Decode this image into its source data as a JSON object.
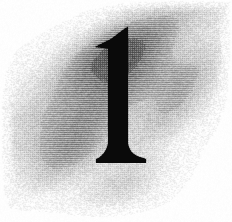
{
  "image": {
    "kind": "decorative-drop-cap",
    "width": 232,
    "height": 222,
    "background_color": "#ffffff",
    "description": "Scanned decorative drop capital: the numeral 1 in a black serif face over a soft diagonal grey cloud wash with visible halftone dot texture",
    "rendering": "halftone",
    "alt_text": "1"
  },
  "glyph": {
    "character": "1",
    "name": "numeral-one",
    "style": "serif",
    "color": "#0a0a0a",
    "top_y": 27,
    "baseline_y": 163,
    "stem": {
      "left_x": 108,
      "right_x": 128,
      "width": 20
    },
    "flag": {
      "tip_x": 95,
      "tip_y": 47,
      "top_y": 27
    },
    "foot_serif": {
      "left_x": 96,
      "right_x": 146,
      "width": 50,
      "top_y": 158,
      "bottom_y": 163,
      "bracket_start_y": 146
    }
  },
  "wash": {
    "name": "cloud-wash",
    "tone_color": "#8a8a8a",
    "max_darkness": 0.62,
    "band_angle_deg": -27,
    "extent": {
      "left_x": 12,
      "right_x": 216,
      "top_y": 8,
      "bottom_y": 200
    },
    "bands": [
      {
        "cx": 118,
        "cy": 50,
        "rx": 104,
        "ry": 30,
        "strength": 0.58
      },
      {
        "cx": 150,
        "cy": 36,
        "rx": 78,
        "ry": 22,
        "strength": 0.52
      },
      {
        "cx": 96,
        "cy": 84,
        "rx": 96,
        "ry": 30,
        "strength": 0.6
      },
      {
        "cx": 166,
        "cy": 78,
        "rx": 62,
        "ry": 26,
        "strength": 0.5
      },
      {
        "cx": 88,
        "cy": 118,
        "rx": 86,
        "ry": 30,
        "strength": 0.55
      },
      {
        "cx": 150,
        "cy": 120,
        "rx": 64,
        "ry": 26,
        "strength": 0.42
      },
      {
        "cx": 82,
        "cy": 150,
        "rx": 70,
        "ry": 26,
        "strength": 0.4
      },
      {
        "cx": 120,
        "cy": 182,
        "rx": 56,
        "ry": 26,
        "strength": 0.34
      }
    ]
  },
  "texture": {
    "name": "halftone-dots",
    "cell_size": 2,
    "noise_amount": 0.16
  }
}
